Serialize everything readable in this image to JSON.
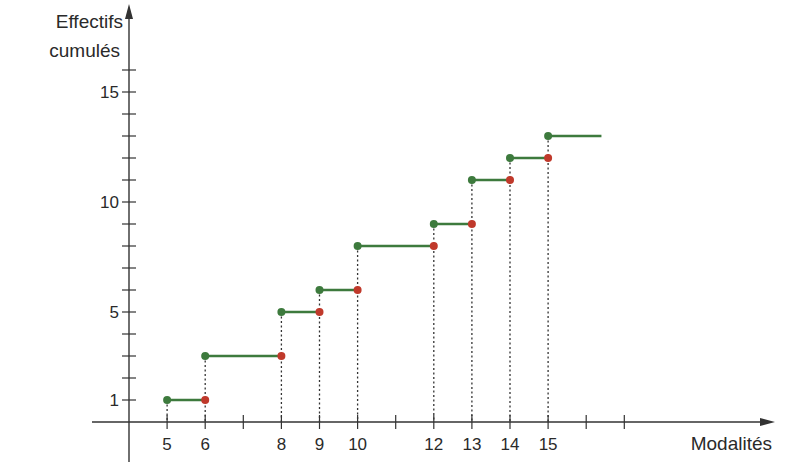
{
  "chart_data": {
    "type": "line",
    "subtype": "step (cumulative frequency)",
    "title": "",
    "ylabel": "Effectifs cumulés",
    "ylabel_lines": [
      "Effectifs",
      "cumulés"
    ],
    "xlabel": "Modalités",
    "x_ticks_labeled": [
      5,
      6,
      8,
      9,
      10,
      12,
      13,
      14,
      15
    ],
    "x_ticks_all": [
      5,
      6,
      7,
      8,
      9,
      10,
      11,
      12,
      13,
      14,
      15,
      16,
      17
    ],
    "y_ticks_labeled": [
      1,
      5,
      10,
      15
    ],
    "y_ticks_all": [
      1,
      2,
      3,
      4,
      5,
      6,
      7,
      8,
      9,
      10,
      11,
      12,
      13,
      14,
      15,
      16
    ],
    "xlim": [
      4,
      20
    ],
    "ylim": [
      0,
      17
    ],
    "grid": false,
    "legend": null,
    "steps": [
      {
        "x_start": 5,
        "x_end": 6,
        "y": 1
      },
      {
        "x_start": 6,
        "x_end": 8,
        "y": 3
      },
      {
        "x_start": 8,
        "x_end": 9,
        "y": 5
      },
      {
        "x_start": 9,
        "x_end": 10,
        "y": 6
      },
      {
        "x_start": 10,
        "x_end": 12,
        "y": 8
      },
      {
        "x_start": 12,
        "x_end": 13,
        "y": 9
      },
      {
        "x_start": 13,
        "x_end": 14,
        "y": 11
      },
      {
        "x_start": 14,
        "x_end": 15,
        "y": 12
      },
      {
        "x_start": 15,
        "x_end": 16.4,
        "y": 13
      }
    ],
    "colors": {
      "segment": "#3d7a3d",
      "closed_point": "#3d7a3d",
      "open_point": "#c0392b",
      "axis": "#333333",
      "guide": "#333333"
    }
  },
  "labels": {
    "y_axis_line1": "Effectifs",
    "y_axis_line2": "cumulés",
    "x_axis": "Modalités"
  }
}
